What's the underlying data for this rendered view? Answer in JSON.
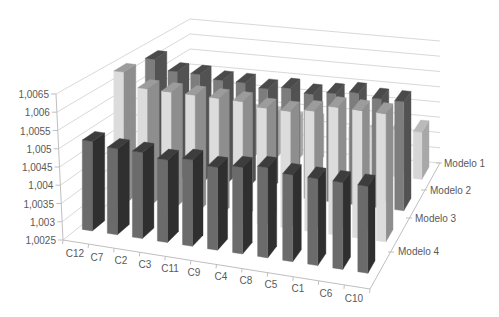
{
  "chart_data": {
    "type": "bar",
    "subtype": "3d-column",
    "title": "",
    "xlabel": "",
    "ylabel": "",
    "ylim": [
      1.0025,
      1.0065
    ],
    "y_ticks": [
      "1,0025",
      "1,003",
      "1,0035",
      "1,004",
      "1,0045",
      "1,005",
      "1,0055",
      "1,006",
      "1,0065"
    ],
    "grid": true,
    "legend": "none",
    "categories": [
      "C12",
      "C7",
      "C2",
      "C3",
      "C11",
      "C9",
      "C4",
      "C8",
      "C5",
      "C1",
      "C6",
      "C10"
    ],
    "series": [
      {
        "name": "Modelo 1",
        "values": [
          1.004,
          1.004,
          1.004,
          1.004,
          1.004,
          1.0039,
          1.0039,
          1.0039,
          1.0039,
          1.004,
          1.004,
          1.004
        ],
        "colors": {
          "front": "#d6d6d6",
          "side": "#a8a8a8",
          "top": "#bababa"
        }
      },
      {
        "name": "Modelo 2",
        "values": [
          1.0062,
          1.0059,
          1.0059,
          1.0058,
          1.0058,
          1.0057,
          1.0058,
          1.0057,
          1.0058,
          1.0059,
          1.0058,
          1.0058
        ],
        "colors": {
          "front": "#7d7d7d",
          "side": "#525252",
          "top": "#4a4a4a"
        }
      },
      {
        "name": "Modelo 3",
        "values": [
          1.0064,
          1.006,
          1.006,
          1.006,
          1.006,
          1.006,
          1.0059,
          1.0059,
          1.006,
          1.0062,
          1.0062,
          1.0062
        ],
        "colors": {
          "front": "#dcdcdc",
          "side": "#8e8e8e",
          "top": "#9c9c9c"
        }
      },
      {
        "name": "Modelo 4",
        "values": [
          1.005,
          1.0049,
          1.0049,
          1.0048,
          1.0049,
          1.0048,
          1.0049,
          1.005,
          1.0049,
          1.0049,
          1.0049,
          1.0049
        ],
        "colors": {
          "front": "#6b6b6b",
          "side": "#2f2f2f",
          "top": "#3d3d3d"
        }
      }
    ]
  },
  "colors": {
    "background": "#ffffff",
    "gridline": "#d9d9d9",
    "axis_line": "#bfbfbf",
    "label": "#595959"
  }
}
